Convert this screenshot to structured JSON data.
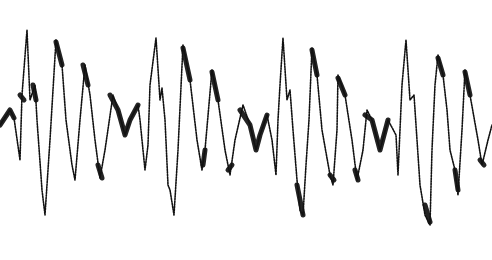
{
  "chart_data": {
    "type": "line",
    "title": "",
    "xlabel": "",
    "ylabel": "",
    "grid": false,
    "legend": null,
    "xlim": [
      0,
      492
    ],
    "ylim": [
      260,
      0
    ],
    "style": {
      "background": "#ffffff",
      "ink": "#111111"
    },
    "series": [
      {
        "name": "waveform-trace",
        "points": [
          [
            0,
            125
          ],
          [
            10,
            110
          ],
          [
            14,
            118
          ],
          [
            20,
            160
          ],
          [
            22,
            95
          ],
          [
            27,
            30
          ],
          [
            30,
            100
          ],
          [
            35,
            85
          ],
          [
            37,
            120
          ],
          [
            42,
            190
          ],
          [
            45,
            215
          ],
          [
            50,
            140
          ],
          [
            56,
            40
          ],
          [
            62,
            65
          ],
          [
            66,
            120
          ],
          [
            72,
            165
          ],
          [
            75,
            180
          ],
          [
            80,
            120
          ],
          [
            85,
            65
          ],
          [
            90,
            95
          ],
          [
            95,
            140
          ],
          [
            100,
            178
          ],
          [
            105,
            150
          ],
          [
            113,
            95
          ],
          [
            118,
            110
          ],
          [
            125,
            135
          ],
          [
            130,
            120
          ],
          [
            138,
            105
          ],
          [
            140,
            120
          ],
          [
            145,
            170
          ],
          [
            148,
            145
          ],
          [
            150,
            85
          ],
          [
            156,
            38
          ],
          [
            160,
            100
          ],
          [
            162,
            88
          ],
          [
            165,
            120
          ],
          [
            168,
            185
          ],
          [
            170,
            190
          ],
          [
            174,
            215
          ],
          [
            178,
            150
          ],
          [
            183,
            45
          ],
          [
            190,
            80
          ],
          [
            197,
            140
          ],
          [
            202,
            170
          ],
          [
            205,
            150
          ],
          [
            212,
            70
          ],
          [
            218,
            100
          ],
          [
            225,
            150
          ],
          [
            230,
            175
          ],
          [
            235,
            140
          ],
          [
            243,
            105
          ],
          [
            250,
            125
          ],
          [
            256,
            150
          ],
          [
            260,
            135
          ],
          [
            267,
            115
          ],
          [
            272,
            140
          ],
          [
            276,
            175
          ],
          [
            278,
            120
          ],
          [
            280,
            85
          ],
          [
            283,
            38
          ],
          [
            287,
            100
          ],
          [
            290,
            90
          ],
          [
            293,
            130
          ],
          [
            297,
            180
          ],
          [
            300,
            210
          ],
          [
            303,
            215
          ],
          [
            306,
            165
          ],
          [
            309,
            120
          ],
          [
            312,
            48
          ],
          [
            317,
            75
          ],
          [
            322,
            130
          ],
          [
            330,
            175
          ],
          [
            333,
            185
          ],
          [
            337,
            130
          ],
          [
            338,
            75
          ],
          [
            345,
            95
          ],
          [
            352,
            140
          ],
          [
            357,
            180
          ],
          [
            363,
            150
          ],
          [
            367,
            110
          ],
          [
            372,
            120
          ],
          [
            380,
            150
          ],
          [
            388,
            120
          ],
          [
            396,
            135
          ],
          [
            398,
            175
          ],
          [
            402,
            85
          ],
          [
            406,
            40
          ],
          [
            410,
            100
          ],
          [
            414,
            95
          ],
          [
            416,
            125
          ],
          [
            420,
            185
          ],
          [
            425,
            215
          ],
          [
            430,
            225
          ],
          [
            432,
            150
          ],
          [
            435,
            85
          ],
          [
            438,
            55
          ],
          [
            443,
            75
          ],
          [
            447,
            110
          ],
          [
            450,
            150
          ],
          [
            455,
            170
          ],
          [
            458,
            195
          ],
          [
            462,
            130
          ],
          [
            465,
            70
          ],
          [
            470,
            95
          ],
          [
            478,
            140
          ],
          [
            482,
            165
          ],
          [
            488,
            140
          ],
          [
            492,
            125
          ]
        ]
      }
    ],
    "thick_segments": [
      [
        [
          0,
          125
        ],
        [
          10,
          110
        ],
        [
          14,
          118
        ]
      ],
      [
        [
          20,
          95
        ],
        [
          24,
          100
        ]
      ],
      [
        [
          33,
          85
        ],
        [
          36,
          100
        ]
      ],
      [
        [
          56,
          42
        ],
        [
          62,
          65
        ]
      ],
      [
        [
          83,
          65
        ],
        [
          88,
          85
        ]
      ],
      [
        [
          98,
          165
        ],
        [
          102,
          178
        ]
      ],
      [
        [
          110,
          95
        ],
        [
          118,
          110
        ],
        [
          125,
          135
        ],
        [
          130,
          120
        ],
        [
          138,
          105
        ]
      ],
      [
        [
          183,
          48
        ],
        [
          190,
          80
        ]
      ],
      [
        [
          203,
          165
        ],
        [
          205,
          150
        ]
      ],
      [
        [
          212,
          72
        ],
        [
          218,
          100
        ]
      ],
      [
        [
          228,
          170
        ],
        [
          232,
          165
        ]
      ],
      [
        [
          240,
          110
        ],
        [
          250,
          125
        ],
        [
          256,
          150
        ],
        [
          260,
          135
        ],
        [
          267,
          115
        ]
      ],
      [
        [
          297,
          185
        ],
        [
          303,
          215
        ]
      ],
      [
        [
          312,
          50
        ],
        [
          317,
          75
        ]
      ],
      [
        [
          330,
          175
        ],
        [
          334,
          180
        ]
      ],
      [
        [
          338,
          78
        ],
        [
          345,
          95
        ]
      ],
      [
        [
          355,
          170
        ],
        [
          358,
          180
        ]
      ],
      [
        [
          365,
          115
        ],
        [
          372,
          120
        ],
        [
          380,
          150
        ],
        [
          388,
          120
        ]
      ],
      [
        [
          425,
          205
        ],
        [
          430,
          222
        ]
      ],
      [
        [
          438,
          58
        ],
        [
          443,
          75
        ]
      ],
      [
        [
          455,
          170
        ],
        [
          458,
          190
        ]
      ],
      [
        [
          465,
          72
        ],
        [
          470,
          95
        ]
      ],
      [
        [
          480,
          160
        ],
        [
          484,
          165
        ]
      ]
    ]
  }
}
